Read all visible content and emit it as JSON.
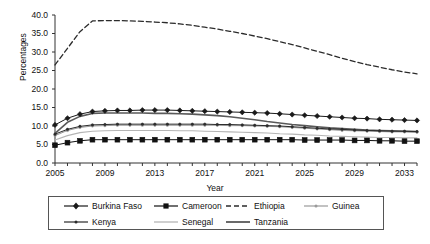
{
  "chart_data": {
    "type": "line",
    "title": "",
    "xlabel": "Year",
    "ylabel": "Percentages",
    "xlim": [
      2005,
      2034
    ],
    "ylim": [
      0.0,
      40.0
    ],
    "ytick_step": 5.0,
    "grid": false,
    "legend_position": "bottom",
    "x": [
      2005,
      2006,
      2007,
      2008,
      2009,
      2010,
      2011,
      2012,
      2013,
      2014,
      2015,
      2016,
      2017,
      2018,
      2019,
      2020,
      2021,
      2022,
      2023,
      2024,
      2025,
      2026,
      2027,
      2028,
      2029,
      2030,
      2031,
      2032,
      2033,
      2034
    ],
    "ytick_labels": [
      "0.0",
      "5.0",
      "10.0",
      "15.0",
      "20.0",
      "25.0",
      "30.0",
      "35.0",
      "40.0"
    ],
    "xtick_labels": [
      "2005",
      "2009",
      "2013",
      "2017",
      "2021",
      "2025",
      "2029",
      "2033"
    ],
    "series": [
      {
        "name": "Burkina Faso",
        "marker": "diamond",
        "style": "solid",
        "color": "#1a1a1a",
        "values": [
          10.3,
          12.1,
          13.2,
          13.9,
          14.1,
          14.2,
          14.2,
          14.3,
          14.3,
          14.3,
          14.2,
          14.1,
          14.0,
          13.9,
          13.8,
          13.7,
          13.6,
          13.5,
          13.3,
          13.1,
          12.9,
          12.7,
          12.5,
          12.3,
          12.1,
          12.0,
          11.8,
          11.7,
          11.6,
          11.5
        ]
      },
      {
        "name": "Cameroon",
        "marker": "square",
        "style": "solid",
        "color": "#111111",
        "values": [
          4.8,
          5.5,
          6.0,
          6.3,
          6.3,
          6.3,
          6.3,
          6.3,
          6.3,
          6.3,
          6.3,
          6.3,
          6.3,
          6.3,
          6.3,
          6.3,
          6.3,
          6.3,
          6.3,
          6.3,
          6.2,
          6.2,
          6.2,
          6.2,
          6.1,
          6.1,
          6.0,
          6.0,
          5.9,
          5.9
        ]
      },
      {
        "name": "Ethiopia",
        "marker": "none",
        "style": "dashed",
        "color": "#2b2b2b",
        "values": [
          26.5,
          31.0,
          35.5,
          38.4,
          38.5,
          38.5,
          38.4,
          38.3,
          38.1,
          37.9,
          37.6,
          37.2,
          36.7,
          36.2,
          35.6,
          35.0,
          34.3,
          33.6,
          32.8,
          32.0,
          31.1,
          30.2,
          29.3,
          28.3,
          27.4,
          26.6,
          25.9,
          25.2,
          24.6,
          24.1
        ]
      },
      {
        "name": "Guinea",
        "marker": "dot",
        "style": "solid",
        "color": "#9a9a9a",
        "values": [
          7.4,
          8.8,
          9.6,
          10.0,
          10.1,
          10.2,
          10.2,
          10.2,
          10.2,
          10.2,
          10.2,
          10.2,
          10.2,
          10.2,
          10.1,
          10.1,
          10.0,
          9.9,
          9.8,
          9.6,
          9.4,
          9.2,
          9.0,
          8.8,
          8.7,
          8.6,
          8.5,
          8.4,
          8.4,
          8.3
        ]
      },
      {
        "name": "Kenya",
        "marker": "dot",
        "style": "solid",
        "color": "#2b2b2b",
        "values": [
          7.8,
          9.1,
          9.9,
          10.3,
          10.4,
          10.5,
          10.5,
          10.5,
          10.5,
          10.5,
          10.5,
          10.5,
          10.5,
          10.4,
          10.4,
          10.3,
          10.2,
          10.1,
          10.0,
          9.8,
          9.6,
          9.4,
          9.2,
          9.1,
          8.9,
          8.8,
          8.7,
          8.6,
          8.6,
          8.5
        ]
      },
      {
        "name": "Senegal",
        "marker": "none",
        "style": "solid-thin",
        "color": "#b5b5b5",
        "values": [
          6.2,
          7.4,
          8.2,
          8.6,
          8.7,
          8.8,
          8.8,
          8.8,
          8.8,
          8.8,
          8.7,
          8.7,
          8.6,
          8.5,
          8.4,
          8.3,
          8.2,
          8.1,
          7.9,
          7.8,
          7.6,
          7.5,
          7.3,
          7.2,
          7.1,
          7.0,
          6.9,
          6.9,
          6.8,
          6.8
        ]
      },
      {
        "name": "Tanzania",
        "marker": "none",
        "style": "solid-thick",
        "color": "#5a5a5a",
        "values": [
          8.0,
          11.0,
          12.6,
          13.4,
          13.5,
          13.5,
          13.5,
          13.5,
          13.4,
          13.4,
          13.3,
          13.2,
          13.0,
          12.8,
          12.5,
          12.1,
          11.7,
          11.2,
          10.8,
          10.4,
          10.1,
          9.8,
          9.5,
          9.3,
          9.1,
          8.9,
          8.8,
          8.7,
          8.6,
          8.5
        ]
      }
    ]
  },
  "legend": {
    "rows": [
      [
        "Burkina Faso",
        "Cameroon",
        "Ethiopia",
        "Guinea"
      ],
      [
        "Kenya",
        "Senegal",
        "Tanzania"
      ]
    ]
  }
}
